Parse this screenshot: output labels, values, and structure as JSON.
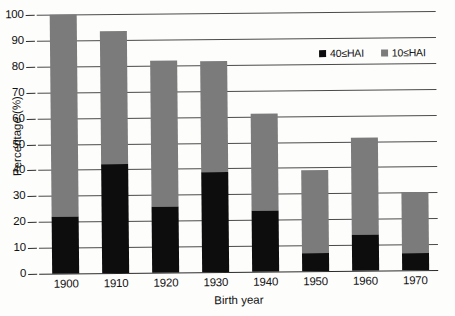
{
  "chart_data": {
    "type": "bar",
    "stacked": true,
    "title": "",
    "xlabel": "Birth year",
    "ylabel": "Percentage (%)",
    "categories": [
      "1900",
      "1910",
      "1920",
      "1930",
      "1940",
      "1950",
      "1960",
      "1970"
    ],
    "ylim": [
      0,
      100
    ],
    "yticks": [
      0,
      10,
      20,
      30,
      40,
      50,
      60,
      70,
      80,
      90,
      100
    ],
    "ytick_labels": [
      "0",
      "10",
      "20",
      "30",
      "40",
      "50",
      "60",
      "70",
      "80",
      "90",
      "100"
    ],
    "grid": true,
    "legend_position": "upper right",
    "series": [
      {
        "name": "40≤HAI",
        "color": "#0d0d0d",
        "values": [
          22,
          42,
          25.5,
          38.5,
          23.5,
          7,
          14,
          6.5
        ]
      },
      {
        "name": "10≤HAI",
        "color": "#7b7b7b",
        "values": [
          100,
          93.5,
          82,
          81.5,
          61,
          39,
          51.5,
          30
        ]
      }
    ],
    "series_note": "10≤HAI values are cumulative bar tops; black 40≤HAI segment is drawn from 0 up, gray fills the remainder."
  }
}
